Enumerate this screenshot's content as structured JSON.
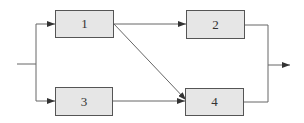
{
  "diagram": {
    "type": "block-diagram",
    "nodes": [
      {
        "id": "1",
        "label": "1"
      },
      {
        "id": "2",
        "label": "2"
      },
      {
        "id": "3",
        "label": "3"
      },
      {
        "id": "4",
        "label": "4"
      }
    ],
    "edges": [
      {
        "from": "input",
        "to": "1"
      },
      {
        "from": "input",
        "to": "3"
      },
      {
        "from": "1",
        "to": "2"
      },
      {
        "from": "1",
        "to": "4"
      },
      {
        "from": "3",
        "to": "4"
      },
      {
        "from": "2",
        "to": "output"
      },
      {
        "from": "4",
        "to": "output"
      }
    ],
    "colors": {
      "box_fill": "#e6e6e6",
      "line": "#555555"
    }
  }
}
